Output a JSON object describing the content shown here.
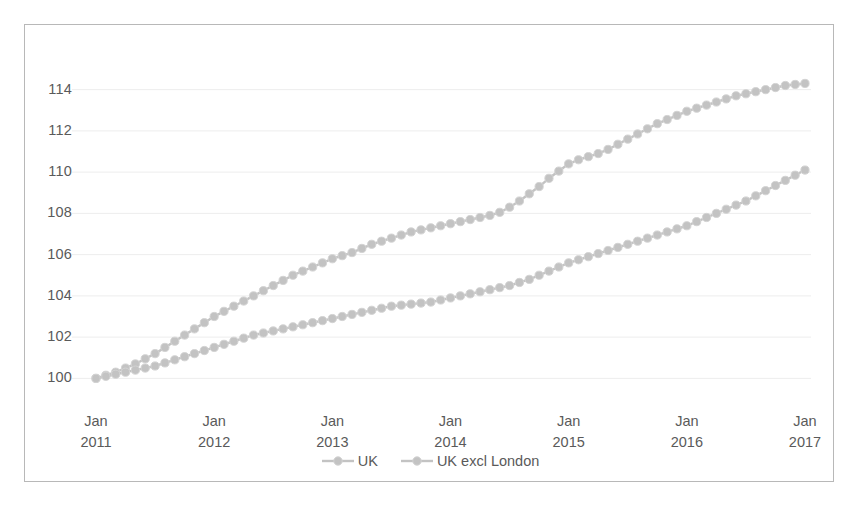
{
  "chart_data": {
    "type": "line",
    "title": "",
    "subtitle": "",
    "xlabel": "",
    "ylabel": "",
    "ylim": [
      99.0,
      115.0
    ],
    "yticks": [
      100,
      102,
      104,
      106,
      108,
      110,
      112,
      114
    ],
    "ytick_labels": [
      "100",
      "102",
      "104",
      "106",
      "108",
      "110",
      "112",
      "114"
    ],
    "grid": "horizontal-light",
    "legend_position": "bottom-center",
    "marker": "circle",
    "xtick_labels": [
      {
        "month": "Jan",
        "year": "2011"
      },
      {
        "month": "Jan",
        "year": "2012"
      },
      {
        "month": "Jan",
        "year": "2013"
      },
      {
        "month": "Jan",
        "year": "2014"
      },
      {
        "month": "Jan",
        "year": "2015"
      },
      {
        "month": "Jan",
        "year": "2016"
      },
      {
        "month": "Jan",
        "year": "2017"
      }
    ],
    "x_start": "Jan 2011",
    "x_end": "Jan 2017",
    "x_step_months": 1,
    "colors": {
      "uk": "#c3c3c3",
      "uk_excl_london": "#c3c3c3",
      "axis_text": "#5a5a5a",
      "grid": "#ededed",
      "border": "#b8b8b8",
      "background": "#ffffff"
    },
    "series": [
      {
        "name": "UK",
        "color": "#c3c3c3",
        "values": [
          100.0,
          100.15,
          100.3,
          100.5,
          100.7,
          100.95,
          101.2,
          101.5,
          101.8,
          102.1,
          102.4,
          102.7,
          103.0,
          103.25,
          103.5,
          103.75,
          104.0,
          104.25,
          104.5,
          104.75,
          105.0,
          105.2,
          105.4,
          105.6,
          105.8,
          105.95,
          106.1,
          106.3,
          106.5,
          106.65,
          106.8,
          106.95,
          107.1,
          107.2,
          107.3,
          107.4,
          107.5,
          107.6,
          107.7,
          107.8,
          107.9,
          108.05,
          108.3,
          108.6,
          108.95,
          109.3,
          109.7,
          110.05,
          110.4,
          110.6,
          110.75,
          110.9,
          111.1,
          111.35,
          111.6,
          111.85,
          112.1,
          112.35,
          112.55,
          112.75,
          112.95,
          113.1,
          113.25,
          113.4,
          113.55,
          113.7,
          113.8,
          113.9,
          114.0,
          114.1,
          114.2,
          114.25,
          114.3
        ]
      },
      {
        "name": "UK excl London",
        "color": "#c3c3c3",
        "values": [
          100.0,
          100.1,
          100.2,
          100.3,
          100.4,
          100.5,
          100.6,
          100.75,
          100.9,
          101.05,
          101.2,
          101.35,
          101.5,
          101.65,
          101.8,
          101.95,
          102.1,
          102.2,
          102.3,
          102.4,
          102.5,
          102.6,
          102.7,
          102.8,
          102.9,
          103.0,
          103.1,
          103.2,
          103.3,
          103.4,
          103.5,
          103.55,
          103.6,
          103.65,
          103.7,
          103.8,
          103.9,
          104.0,
          104.1,
          104.2,
          104.3,
          104.4,
          104.5,
          104.65,
          104.8,
          105.0,
          105.2,
          105.4,
          105.6,
          105.75,
          105.9,
          106.05,
          106.2,
          106.35,
          106.5,
          106.65,
          106.8,
          106.95,
          107.1,
          107.25,
          107.4,
          107.6,
          107.8,
          108.0,
          108.2,
          108.4,
          108.6,
          108.85,
          109.1,
          109.35,
          109.6,
          109.85,
          110.1
        ]
      }
    ]
  },
  "legend": {
    "items": [
      {
        "label": "UK"
      },
      {
        "label": "UK excl London"
      }
    ]
  }
}
